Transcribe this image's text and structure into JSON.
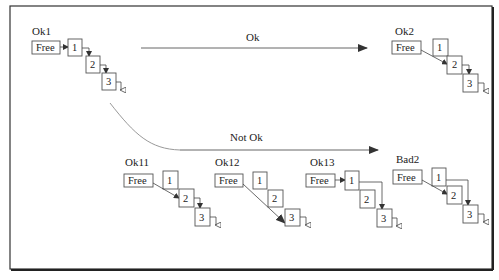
{
  "diagram": {
    "transitions": {
      "ok_label": "Ok",
      "not_ok_label": "Not Ok"
    },
    "free_label": "Free",
    "states": [
      {
        "id": "ok1",
        "label": "Ok1",
        "cells": [
          "1",
          "2",
          "3"
        ],
        "free_points_to": "1",
        "links": [
          "1->2",
          "2->3",
          "3->nil"
        ]
      },
      {
        "id": "ok2",
        "label": "Ok2",
        "cells": [
          "1",
          "2",
          "3"
        ],
        "free_points_to": "2",
        "links": [
          "2->3",
          "3->nil"
        ]
      },
      {
        "id": "ok11",
        "label": "Ok11",
        "cells": [
          "1",
          "2",
          "3"
        ],
        "free_points_to": "2",
        "links": [
          "2->3",
          "3->nil"
        ]
      },
      {
        "id": "ok12",
        "label": "Ok12",
        "cells": [
          "1",
          "2",
          "3"
        ],
        "free_points_to": "3",
        "links": [
          "3->nil"
        ]
      },
      {
        "id": "ok13",
        "label": "Ok13",
        "cells": [
          "1",
          "2",
          "3"
        ],
        "free_points_to": "1",
        "links": [
          "1->3",
          "3->nil"
        ]
      },
      {
        "id": "bad2",
        "label": "Bad2",
        "cells": [
          "1",
          "2",
          "3"
        ],
        "free_points_to": "2",
        "links": [
          "1->3",
          "3->nil"
        ]
      }
    ],
    "colors": {
      "stroke": "#444444",
      "curve": "#999999",
      "background": "#ffffff"
    }
  }
}
